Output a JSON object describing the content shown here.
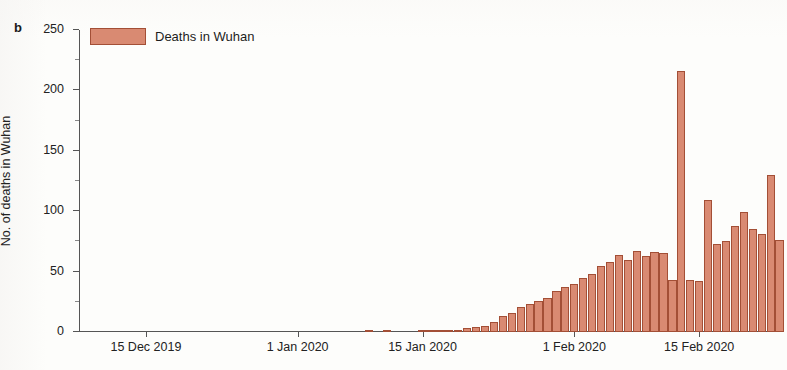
{
  "figure": {
    "panel_label": "b",
    "background_color": "#fdfdfb"
  },
  "legend": {
    "position": "top-left",
    "label": "Deaths in Wuhan",
    "swatch_color": "#d98a72",
    "swatch_border_color": "#a34f36"
  },
  "axes": {
    "y_title": "No. of deaths in Wuhan",
    "y_ticks": [
      "0",
      "50",
      "100",
      "150",
      "200",
      "250"
    ],
    "x_ticks": [
      "15 Dec 2019",
      "1 Jan 2020",
      "15 Jan 2020",
      "1 Feb 2020",
      "15 Feb 2020"
    ]
  },
  "chart_data": {
    "type": "bar",
    "title": "",
    "subtitle": "",
    "xlabel": "",
    "ylabel": "No. of deaths in Wuhan",
    "ylim": [
      0,
      250
    ],
    "y_tick_values": [
      0,
      50,
      100,
      150,
      200,
      250
    ],
    "y_minor_tick_step": 25,
    "grid": false,
    "legend_position": "top-left",
    "bar_color": "#d98a72",
    "bar_edge_color": "#a34f36",
    "x_type": "date",
    "x_start": "2019-12-08",
    "x_end": "2020-02-24",
    "x_tick_labels": [
      "15 Dec 2019",
      "1 Jan 2020",
      "15 Jan 2020",
      "1 Feb 2020",
      "15 Feb 2020"
    ],
    "x_tick_dates": [
      "2019-12-15",
      "2020-01-01",
      "2020-01-15",
      "2020-02-01",
      "2020-02-15"
    ],
    "series": [
      {
        "name": "Deaths in Wuhan",
        "color": "#d98a72",
        "dates": [
          "2019-12-08",
          "2019-12-09",
          "2019-12-10",
          "2019-12-11",
          "2019-12-12",
          "2019-12-13",
          "2019-12-14",
          "2019-12-15",
          "2019-12-16",
          "2019-12-17",
          "2019-12-18",
          "2019-12-19",
          "2019-12-20",
          "2019-12-21",
          "2019-12-22",
          "2019-12-23",
          "2019-12-24",
          "2019-12-25",
          "2019-12-26",
          "2019-12-27",
          "2019-12-28",
          "2019-12-29",
          "2019-12-30",
          "2019-12-31",
          "2020-01-01",
          "2020-01-02",
          "2020-01-03",
          "2020-01-04",
          "2020-01-05",
          "2020-01-06",
          "2020-01-07",
          "2020-01-08",
          "2020-01-09",
          "2020-01-10",
          "2020-01-11",
          "2020-01-12",
          "2020-01-13",
          "2020-01-14",
          "2020-01-15",
          "2020-01-16",
          "2020-01-17",
          "2020-01-18",
          "2020-01-19",
          "2020-01-20",
          "2020-01-21",
          "2020-01-22",
          "2020-01-23",
          "2020-01-24",
          "2020-01-25",
          "2020-01-26",
          "2020-01-27",
          "2020-01-28",
          "2020-01-29",
          "2020-01-30",
          "2020-01-31",
          "2020-02-01",
          "2020-02-02",
          "2020-02-03",
          "2020-02-04",
          "2020-02-05",
          "2020-02-06",
          "2020-02-07",
          "2020-02-08",
          "2020-02-09",
          "2020-02-10",
          "2020-02-11",
          "2020-02-12",
          "2020-02-13",
          "2020-02-14",
          "2020-02-15",
          "2020-02-16",
          "2020-02-17",
          "2020-02-18",
          "2020-02-19",
          "2020-02-20",
          "2020-02-21",
          "2020-02-22",
          "2020-02-23",
          "2020-02-24"
        ],
        "values": [
          0,
          0,
          0,
          0,
          0,
          0,
          0,
          0,
          0,
          0,
          0,
          0,
          0,
          0,
          0,
          0,
          0,
          0,
          0,
          0,
          0,
          0,
          0,
          0,
          0,
          0,
          0,
          0,
          0,
          0,
          0,
          0,
          1,
          0,
          1,
          0,
          0,
          0,
          1,
          1,
          1,
          2,
          2,
          3,
          4,
          5,
          8,
          13,
          16,
          21,
          23,
          26,
          28,
          34,
          37,
          40,
          45,
          48,
          55,
          58,
          64,
          60,
          67,
          63,
          66,
          65,
          43,
          216,
          43,
          42,
          109,
          73,
          75,
          88,
          99,
          85,
          81,
          130,
          76
        ]
      }
    ],
    "annotations": [
      {
        "date": "2020-02-13",
        "value": 216,
        "note": "clinical-diagnosis reporting spike"
      }
    ]
  }
}
